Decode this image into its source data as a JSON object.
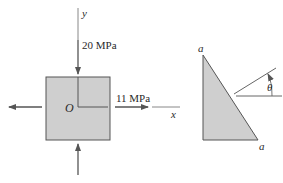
{
  "figure": {
    "stress_element": {
      "origin_label": "O",
      "x_axis_label": "x",
      "y_axis_label": "y",
      "vertical_stress_label": "20 MPa",
      "horizontal_stress_label": "11 MPa",
      "vertical_stress_value": 20,
      "horizontal_stress_value": 11,
      "units": "MPa"
    },
    "inclined_section": {
      "top_vertex_label": "a",
      "bottom_vertex_label": "a",
      "angle_label": "θ"
    },
    "colors": {
      "fill": "#cfcfcf",
      "stroke": "#555555",
      "text": "#2a2a2a"
    }
  }
}
